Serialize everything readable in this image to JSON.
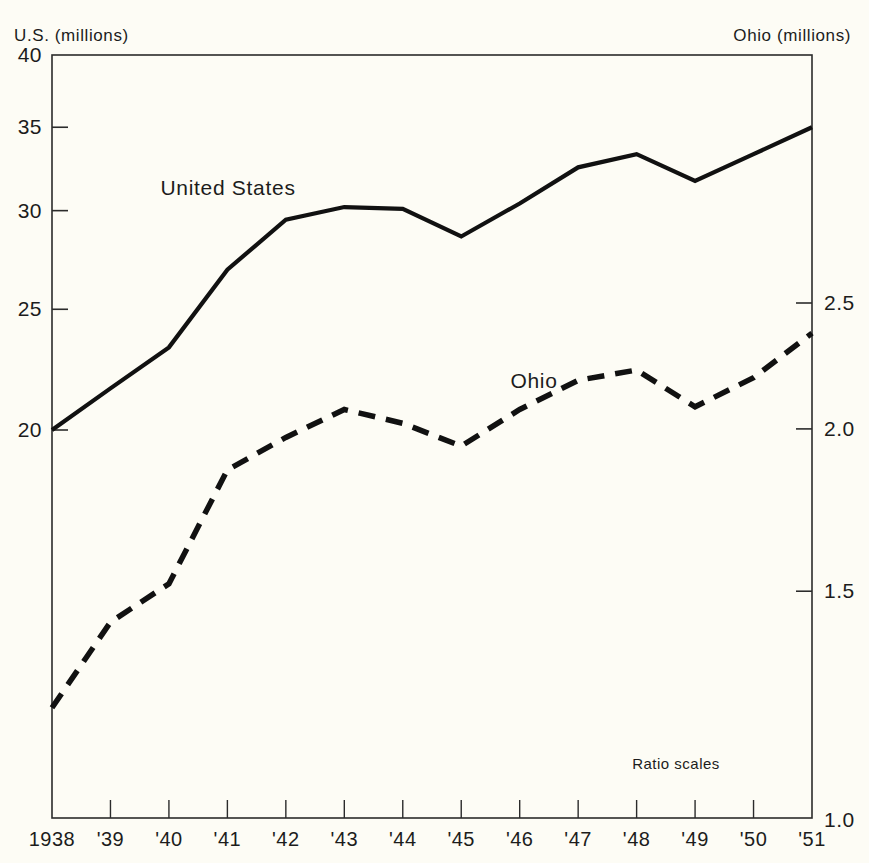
{
  "chart_data": {
    "type": "line",
    "title": "",
    "subtitle": "",
    "xlabel": "",
    "ylabel": "U.S. (millions)",
    "ylabel_right": "Ohio (millions)",
    "scale": "log",
    "grid": false,
    "legend_position": "inline-annotation",
    "annotation": "Ratio scales",
    "x": [
      1938,
      1939,
      1940,
      1941,
      1942,
      1943,
      1944,
      1945,
      1946,
      1947,
      1948,
      1949,
      1950,
      1951
    ],
    "categories": [
      "1938",
      "'39",
      "'40",
      "'41",
      "'42",
      "'43",
      "'44",
      "'45",
      "'46",
      "'47",
      "'48",
      "'49",
      "'50",
      "'51"
    ],
    "yticks_left": [
      "40",
      "35",
      "30",
      "25",
      "20"
    ],
    "yticks_left_values": [
      40,
      35,
      30,
      25,
      20
    ],
    "ylim_left": [
      19.2,
      40
    ],
    "yticks_right": [
      "2.5",
      "2.0",
      "1.5",
      "1.0"
    ],
    "yticks_right_values": [
      2.5,
      2.0,
      1.5,
      1.0
    ],
    "ylim_right": [
      1.0,
      2.75
    ],
    "series": [
      {
        "name": "United States",
        "axis": "left",
        "style": "solid",
        "color": "#111111",
        "values": [
          20.0,
          21.6,
          23.3,
          26.9,
          29.5,
          30.2,
          30.1,
          28.6,
          30.4,
          32.5,
          33.3,
          31.7,
          33.3,
          35.0
        ]
      },
      {
        "name": "Ohio",
        "axis": "right",
        "style": "dashed",
        "color": "#111111",
        "values": [
          1.22,
          1.42,
          1.52,
          1.86,
          1.97,
          2.07,
          2.02,
          1.94,
          2.07,
          2.18,
          2.22,
          2.08,
          2.19,
          2.37
        ]
      }
    ]
  },
  "labels": {
    "us_series_label": "United States",
    "ohio_series_label": "Ohio",
    "ratio_scales": "Ratio scales",
    "left_axis_title": "U.S. (millions)",
    "right_axis_title": "Ohio (millions)"
  }
}
